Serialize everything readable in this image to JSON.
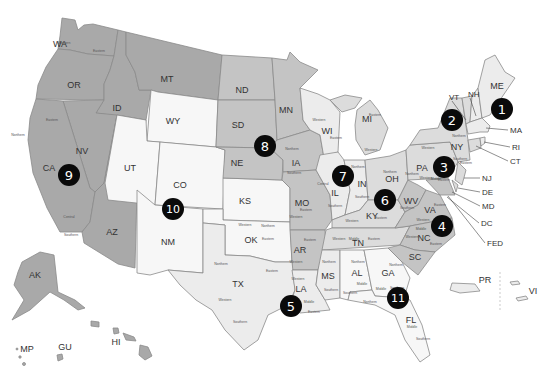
{
  "map": {
    "title": "",
    "states": [
      {
        "id": "WA",
        "label": "WA",
        "circuit": 9,
        "x": 60,
        "y": 44
      },
      {
        "id": "OR",
        "label": "OR",
        "circuit": 9,
        "x": 74,
        "y": 85
      },
      {
        "id": "ID",
        "label": "ID",
        "circuit": 9,
        "x": 117,
        "y": 108
      },
      {
        "id": "MT",
        "label": "MT",
        "circuit": 9,
        "x": 167,
        "y": 79
      },
      {
        "id": "NV",
        "label": "NV",
        "circuit": 9,
        "x": 82,
        "y": 151
      },
      {
        "id": "CA",
        "label": "CA",
        "circuit": 9,
        "x": 49,
        "y": 168
      },
      {
        "id": "AZ",
        "label": "AZ",
        "circuit": 9,
        "x": 112,
        "y": 232
      },
      {
        "id": "AK",
        "label": "AK",
        "circuit": 9,
        "x": 35,
        "y": 275
      },
      {
        "id": "HI",
        "label": "HI",
        "circuit": 9,
        "x": 116,
        "y": 342
      },
      {
        "id": "GU",
        "label": "GU",
        "circuit": 9,
        "x": 65,
        "y": 347
      },
      {
        "id": "MP",
        "label": "MP",
        "circuit": 9,
        "x": 27,
        "y": 349
      },
      {
        "id": "WY",
        "label": "WY",
        "circuit": 10,
        "x": 173,
        "y": 121
      },
      {
        "id": "UT",
        "label": "UT",
        "circuit": 10,
        "x": 130,
        "y": 168
      },
      {
        "id": "CO",
        "label": "CO",
        "circuit": 10,
        "x": 180,
        "y": 185
      },
      {
        "id": "NM",
        "label": "NM",
        "circuit": 10,
        "x": 168,
        "y": 242
      },
      {
        "id": "KS",
        "label": "KS",
        "circuit": 10,
        "x": 245,
        "y": 201
      },
      {
        "id": "OK",
        "label": "OK",
        "circuit": 10,
        "x": 251,
        "y": 240
      },
      {
        "id": "ND",
        "label": "ND",
        "circuit": 8,
        "x": 242,
        "y": 90
      },
      {
        "id": "SD",
        "label": "SD",
        "circuit": 8,
        "x": 238,
        "y": 125
      },
      {
        "id": "NE",
        "label": "NE",
        "circuit": 8,
        "x": 237,
        "y": 163
      },
      {
        "id": "MN",
        "label": "MN",
        "circuit": 8,
        "x": 286,
        "y": 110
      },
      {
        "id": "IA",
        "label": "IA",
        "circuit": 8,
        "x": 296,
        "y": 163
      },
      {
        "id": "MO",
        "label": "MO",
        "circuit": 8,
        "x": 302,
        "y": 203
      },
      {
        "id": "AR",
        "label": "AR",
        "circuit": 8,
        "x": 300,
        "y": 250
      },
      {
        "id": "WI",
        "label": "WI",
        "circuit": 7,
        "x": 327,
        "y": 131
      },
      {
        "id": "IL",
        "label": "IL",
        "circuit": 7,
        "x": 335,
        "y": 193
      },
      {
        "id": "IN",
        "label": "IN",
        "circuit": 7,
        "x": 362,
        "y": 184
      },
      {
        "id": "MI",
        "label": "MI",
        "circuit": 6,
        "x": 367,
        "y": 119
      },
      {
        "id": "OH",
        "label": "OH",
        "circuit": 6,
        "x": 392,
        "y": 179
      },
      {
        "id": "KY",
        "label": "KY",
        "circuit": 6,
        "x": 372,
        "y": 216
      },
      {
        "id": "TN",
        "label": "TN",
        "circuit": 6,
        "x": 358,
        "y": 243
      },
      {
        "id": "TX",
        "label": "TX",
        "circuit": 5,
        "x": 238,
        "y": 284
      },
      {
        "id": "LA",
        "label": "LA",
        "circuit": 5,
        "x": 301,
        "y": 289
      },
      {
        "id": "MS",
        "label": "MS",
        "circuit": 5,
        "x": 328,
        "y": 276
      },
      {
        "id": "AL",
        "label": "AL",
        "circuit": 11,
        "x": 357,
        "y": 273
      },
      {
        "id": "GA",
        "label": "GA",
        "circuit": 11,
        "x": 388,
        "y": 273
      },
      {
        "id": "FL",
        "label": "FL",
        "circuit": 11,
        "x": 411,
        "y": 320
      },
      {
        "id": "WV",
        "label": "WV",
        "circuit": 4,
        "x": 411,
        "y": 201
      },
      {
        "id": "VA",
        "label": "VA",
        "circuit": 4,
        "x": 430,
        "y": 210
      },
      {
        "id": "NC",
        "label": "NC",
        "circuit": 4,
        "x": 424,
        "y": 238
      },
      {
        "id": "SC",
        "label": "SC",
        "circuit": 4,
        "x": 415,
        "y": 257
      },
      {
        "id": "PA",
        "label": "PA",
        "circuit": 3,
        "x": 422,
        "y": 168
      },
      {
        "id": "NY",
        "label": "NY",
        "circuit": 2,
        "x": 457,
        "y": 147
      },
      {
        "id": "ME",
        "label": "ME",
        "circuit": 1,
        "x": 497,
        "y": 86
      },
      {
        "id": "PR",
        "label": "PR",
        "circuit": 1,
        "x": 485,
        "y": 280
      },
      {
        "id": "VI",
        "label": "VI",
        "circuit": 3,
        "x": 533,
        "y": 291
      }
    ],
    "callouts": [
      {
        "label": "VT",
        "x": 449,
        "y": 97
      },
      {
        "label": "NH",
        "x": 468,
        "y": 94
      },
      {
        "label": "MA",
        "x": 510,
        "y": 130
      },
      {
        "label": "RI",
        "x": 512,
        "y": 147
      },
      {
        "label": "CT",
        "x": 510,
        "y": 161
      },
      {
        "label": "NJ",
        "x": 482,
        "y": 178
      },
      {
        "label": "DE",
        "x": 482,
        "y": 192
      },
      {
        "label": "MD",
        "x": 482,
        "y": 206
      },
      {
        "label": "DC",
        "x": 481,
        "y": 223
      },
      {
        "label": "FED",
        "x": 487,
        "y": 243
      }
    ],
    "circuits": [
      {
        "number": "1",
        "x": 502,
        "y": 109
      },
      {
        "number": "2",
        "x": 452,
        "y": 120
      },
      {
        "number": "3",
        "x": 444,
        "y": 167
      },
      {
        "number": "4",
        "x": 442,
        "y": 226
      },
      {
        "number": "5",
        "x": 291,
        "y": 306
      },
      {
        "number": "6",
        "x": 385,
        "y": 200
      },
      {
        "number": "7",
        "x": 343,
        "y": 176
      },
      {
        "number": "8",
        "x": 265,
        "y": 146
      },
      {
        "number": "9",
        "x": 69,
        "y": 175
      },
      {
        "number": "10",
        "x": 173,
        "y": 209
      },
      {
        "number": "11",
        "x": 398,
        "y": 298
      }
    ],
    "district_labels": [
      {
        "text": "Western",
        "x": 64,
        "y": 43
      },
      {
        "text": "Eastern",
        "x": 99,
        "y": 51
      },
      {
        "text": "Northern",
        "x": 18,
        "y": 135
      },
      {
        "text": "Eastern",
        "x": 52,
        "y": 120
      },
      {
        "text": "Central",
        "x": 69,
        "y": 217
      },
      {
        "text": "Southern",
        "x": 71,
        "y": 235
      },
      {
        "text": "Northern",
        "x": 292,
        "y": 149
      },
      {
        "text": "Southern",
        "x": 294,
        "y": 173
      },
      {
        "text": "Western",
        "x": 319,
        "y": 120
      },
      {
        "text": "Eastern",
        "x": 336,
        "y": 138
      },
      {
        "text": "Eastern",
        "x": 375,
        "y": 115
      },
      {
        "text": "Western",
        "x": 371,
        "y": 150
      },
      {
        "text": "Central",
        "x": 323,
        "y": 184
      },
      {
        "text": "Southern",
        "x": 335,
        "y": 206
      },
      {
        "text": "Northern",
        "x": 358,
        "y": 167
      },
      {
        "text": "Southern",
        "x": 362,
        "y": 197
      },
      {
        "text": "Northern",
        "x": 390,
        "y": 172
      },
      {
        "text": "Eastern",
        "x": 306,
        "y": 210
      },
      {
        "text": "Western",
        "x": 296,
        "y": 217
      },
      {
        "text": "Western",
        "x": 352,
        "y": 221
      },
      {
        "text": "Eastern",
        "x": 381,
        "y": 218
      },
      {
        "text": "Western",
        "x": 339,
        "y": 239
      },
      {
        "text": "Middle",
        "x": 354,
        "y": 239
      },
      {
        "text": "Eastern",
        "x": 374,
        "y": 239
      },
      {
        "text": "Eastern",
        "x": 310,
        "y": 240
      },
      {
        "text": "Western",
        "x": 296,
        "y": 262
      },
      {
        "text": "Western",
        "x": 245,
        "y": 225
      },
      {
        "text": "Northern",
        "x": 268,
        "y": 226
      },
      {
        "text": "Eastern",
        "x": 268,
        "y": 239
      },
      {
        "text": "Northern",
        "x": 221,
        "y": 264
      },
      {
        "text": "Eastern",
        "x": 272,
        "y": 271
      },
      {
        "text": "Western",
        "x": 225,
        "y": 300
      },
      {
        "text": "Southern",
        "x": 240,
        "y": 322
      },
      {
        "text": "Western",
        "x": 298,
        "y": 279
      },
      {
        "text": "Middle",
        "x": 309,
        "y": 302
      },
      {
        "text": "Eastern",
        "x": 314,
        "y": 312
      },
      {
        "text": "Northern",
        "x": 329,
        "y": 262
      },
      {
        "text": "Southern",
        "x": 331,
        "y": 290
      },
      {
        "text": "Northern",
        "x": 358,
        "y": 262
      },
      {
        "text": "Middle",
        "x": 362,
        "y": 284
      },
      {
        "text": "Southern",
        "x": 350,
        "y": 293
      },
      {
        "text": "Northern",
        "x": 396,
        "y": 265
      },
      {
        "text": "Middle",
        "x": 381,
        "y": 289
      },
      {
        "text": "Southern",
        "x": 397,
        "y": 288
      },
      {
        "text": "Northern",
        "x": 370,
        "y": 302
      },
      {
        "text": "Middle",
        "x": 412,
        "y": 327
      },
      {
        "text": "Southern",
        "x": 423,
        "y": 339
      },
      {
        "text": "Northern",
        "x": 412,
        "y": 174
      },
      {
        "text": "Southern",
        "x": 407,
        "y": 208
      },
      {
        "text": "Western",
        "x": 426,
        "y": 178
      },
      {
        "text": "Middle",
        "x": 436,
        "y": 179
      },
      {
        "text": "Eastern",
        "x": 444,
        "y": 180
      },
      {
        "text": "Western",
        "x": 423,
        "y": 220
      },
      {
        "text": "Eastern",
        "x": 440,
        "y": 205
      },
      {
        "text": "Middle",
        "x": 421,
        "y": 229
      },
      {
        "text": "Western",
        "x": 412,
        "y": 237
      },
      {
        "text": "Eastern",
        "x": 436,
        "y": 244
      },
      {
        "text": "Western",
        "x": 428,
        "y": 148
      },
      {
        "text": "Northern",
        "x": 459,
        "y": 136
      },
      {
        "text": "Southern",
        "x": 460,
        "y": 159
      },
      {
        "text": "Eastern",
        "x": 466,
        "y": 163
      }
    ]
  }
}
